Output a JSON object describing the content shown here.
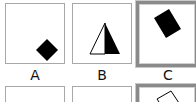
{
  "choices": [
    {
      "label": "A",
      "shape": "diamond-filled",
      "selected": false
    },
    {
      "label": "B",
      "shape": "triangle-half-filled",
      "selected": false
    },
    {
      "label": "C",
      "shape": "rotated-rectangle-filled",
      "selected": true
    }
  ],
  "row2": [
    {
      "shape": "empty",
      "selected": false
    },
    {
      "shape": "empty",
      "selected": false
    },
    {
      "shape": "rotated-square-outline",
      "selected": true
    }
  ],
  "colors": {
    "border": "#a8a8a8",
    "selected_border": "#8a8a8a",
    "shape": "#000000"
  }
}
